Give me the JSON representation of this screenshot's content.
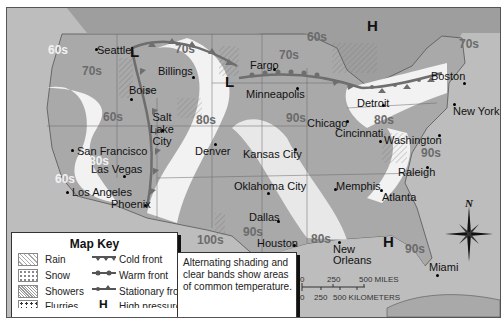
{
  "title": {
    "partial": "Weather map of the United States (title cut off)"
  },
  "cities": [
    {
      "name": "Seattle",
      "x": 92,
      "y": 40
    },
    {
      "name": "Billings",
      "x": 151,
      "y": 62
    },
    {
      "name": "Fargo",
      "x": 249,
      "y": 57
    },
    {
      "name": "Boise",
      "x": 127,
      "y": 80
    },
    {
      "name": "Minneapolis",
      "x": 245,
      "y": 84
    },
    {
      "name": "Boston",
      "x": 431,
      "y": 68
    },
    {
      "name": "Detroit",
      "x": 357,
      "y": 94
    },
    {
      "name": "New York",
      "x": 449,
      "y": 101
    },
    {
      "name": "Salt Lake City",
      "x": 146,
      "y": 107
    },
    {
      "name": "Chicago",
      "x": 304,
      "y": 113
    },
    {
      "name": "Cincinnati",
      "x": 333,
      "y": 125
    },
    {
      "name": "Washington",
      "x": 383,
      "y": 131
    },
    {
      "name": "San Francisco",
      "x": 75,
      "y": 141
    },
    {
      "name": "Denver",
      "x": 194,
      "y": 142
    },
    {
      "name": "Kansas City",
      "x": 242,
      "y": 145
    },
    {
      "name": "Las Vegas",
      "x": 89,
      "y": 159
    },
    {
      "name": "Raleigh",
      "x": 396,
      "y": 163
    },
    {
      "name": "Oklahoma City",
      "x": 233,
      "y": 177
    },
    {
      "name": "Memphis",
      "x": 334,
      "y": 177
    },
    {
      "name": "Los Angeles",
      "x": 70,
      "y": 182
    },
    {
      "name": "Atlanta",
      "x": 380,
      "y": 188
    },
    {
      "name": "Phoenix",
      "x": 110,
      "y": 194
    },
    {
      "name": "Dallas",
      "x": 248,
      "y": 208
    },
    {
      "name": "Houston",
      "x": 256,
      "y": 234
    },
    {
      "name": "New Orleans",
      "x": 332,
      "y": 240
    },
    {
      "name": "Miami",
      "x": 428,
      "y": 258
    }
  ],
  "temperatures": [
    {
      "label": "60s",
      "x": 47,
      "y": 43,
      "light": true
    },
    {
      "label": "70s",
      "x": 75,
      "y": 60,
      "light": false
    },
    {
      "label": "70s",
      "x": 168,
      "y": 40,
      "light": false
    },
    {
      "label": "60s",
      "x": 300,
      "y": 26,
      "light": false
    },
    {
      "label": "70s",
      "x": 273,
      "y": 44,
      "light": false
    },
    {
      "label": "70s",
      "x": 450,
      "y": 30,
      "light": false
    },
    {
      "label": "60s",
      "x": 96,
      "y": 107,
      "light": false
    },
    {
      "label": "80s",
      "x": 84,
      "y": 146,
      "light": true
    },
    {
      "label": "60s",
      "x": 50,
      "y": 166,
      "light": true
    },
    {
      "label": "80s",
      "x": 192,
      "y": 106,
      "light": false
    },
    {
      "label": "90s",
      "x": 281,
      "y": 106,
      "light": false
    },
    {
      "label": "80s",
      "x": 368,
      "y": 106,
      "light": false
    },
    {
      "label": "90s",
      "x": 415,
      "y": 138,
      "light": false
    },
    {
      "label": "100s",
      "x": 192,
      "y": 228,
      "light": false
    },
    {
      "label": "90s",
      "x": 237,
      "y": 219,
      "light": false
    },
    {
      "label": "80s",
      "x": 305,
      "y": 228,
      "light": false
    },
    {
      "label": "90s",
      "x": 399,
      "y": 235,
      "light": false
    }
  ],
  "pressure_systems": [
    {
      "type": "L",
      "label": "Low pressure",
      "x": 129,
      "y": 43
    },
    {
      "type": "L",
      "label": "Low pressure",
      "x": 223,
      "y": 73
    },
    {
      "type": "H",
      "label": "High pressure",
      "x": 365,
      "y": 17
    },
    {
      "type": "H",
      "label": "High pressure",
      "x": 381,
      "y": 233
    }
  ],
  "map_key": {
    "title": "Map Key",
    "precipitation": [
      "Rain",
      "Snow",
      "Showers",
      "Flurries",
      "Ice"
    ],
    "symbols": [
      "Cold front",
      "Warm front",
      "Stationary front",
      "High pressure",
      "Low pressure"
    ],
    "H": "H",
    "L": "L"
  },
  "note": "Alternating shading and clear bands show areas of common temperature.",
  "scale": {
    "miles_0": "0",
    "miles_250": "250",
    "miles_500": "500 MILES",
    "km_0": "0",
    "km_250": "250",
    "km_500": "500 KILOMETERS"
  },
  "compass": {
    "north_label": "N"
  },
  "colors": {
    "ocean": "#bdbdbd",
    "land_band_dark": "#a9a9a9",
    "land_band_light": "#f2f2f2",
    "front": "#6e6e6e"
  }
}
